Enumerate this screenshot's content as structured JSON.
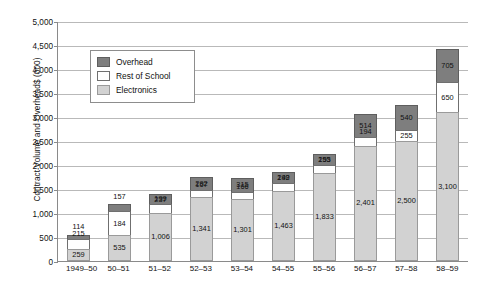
{
  "chart_data": {
    "type": "bar",
    "subtype": "stacked-column",
    "title": "",
    "xlabel": "",
    "ylabel": "Contract Volume and Overhead$ (000)",
    "ylim": [
      0,
      5000
    ],
    "ytick_step": 500,
    "ytick_labels": [
      "0",
      "500",
      "1,000",
      "1,500",
      "2,000",
      "2,500",
      "3,000",
      "3,500",
      "4,000",
      "4,500",
      "5,000"
    ],
    "grid": true,
    "legend_position": "upper-left-inset",
    "categories": [
      "1949–50",
      "50–51",
      "51–52",
      "52–53",
      "53–54",
      "54–55",
      "55–56",
      "56–57",
      "57–58",
      "58–59"
    ],
    "stack_order_bottom_to_top": [
      "Electronics",
      "Rest of School",
      "Overhead"
    ],
    "series": [
      {
        "name": "Electronics",
        "color": "#d2d2d2",
        "values": [
          259,
          535,
          1006,
          1341,
          1301,
          1463,
          1833,
          2401,
          2500,
          3100
        ],
        "labels": [
          "259",
          "535",
          "1,006",
          "1,341",
          "1,301",
          "1,463",
          "1,833",
          "2,401",
          "2,500",
          "3,100"
        ]
      },
      {
        "name": "Rest of School",
        "color": "#ffffff",
        "values": [
          215,
          535,
          199,
          167,
          166,
          192,
          195,
          194,
          255,
          650
        ],
        "labels": [
          "215",
          "184",
          "199",
          "167",
          "166",
          "192",
          "195",
          "194",
          "255",
          "650"
        ]
      },
      {
        "name": "Overhead",
        "color": "#7e7e7e",
        "values": [
          114,
          157,
          237,
          292,
          315,
          249,
          253,
          514,
          540,
          705
        ],
        "labels": [
          "114",
          "157",
          "237",
          "292",
          "315",
          "249",
          "253",
          "514",
          "540",
          "705"
        ]
      }
    ]
  },
  "legend": {
    "items": [
      {
        "label": "Overhead",
        "swatch": "overhead"
      },
      {
        "label": "Rest of School",
        "swatch": "rest"
      },
      {
        "label": "Electronics",
        "swatch": "elec"
      }
    ]
  }
}
